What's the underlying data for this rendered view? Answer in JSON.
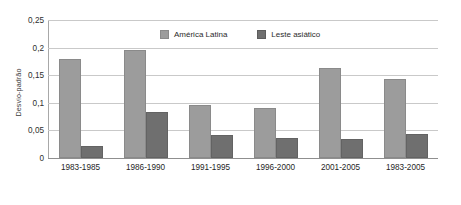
{
  "chart_data": {
    "type": "bar",
    "title": "",
    "xlabel": "",
    "ylabel": "Desvio-padrão",
    "ylim": [
      0,
      0.25
    ],
    "ytick_labels": [
      "0",
      "0,05",
      "0,1",
      "0,15",
      "0,2",
      "0,25"
    ],
    "ytick_values": [
      0,
      0.05,
      0.1,
      0.15,
      0.2,
      0.25
    ],
    "grid": true,
    "legend_position": "top-center",
    "categories": [
      "1983-1985",
      "1986-1990",
      "1991-1995",
      "1996-2000",
      "2001-2005",
      "1983-2005"
    ],
    "series": [
      {
        "name": "América Latina",
        "color": "#9c9c9c",
        "values": [
          0.18,
          0.196,
          0.096,
          0.09,
          0.163,
          0.144
        ]
      },
      {
        "name": "Leste asiático",
        "color": "#6f6f6f",
        "values": [
          0.021,
          0.084,
          0.041,
          0.036,
          0.034,
          0.044
        ]
      }
    ]
  },
  "legend": {
    "items": [
      {
        "label": "América Latina"
      },
      {
        "label": "Leste asiático"
      }
    ]
  }
}
